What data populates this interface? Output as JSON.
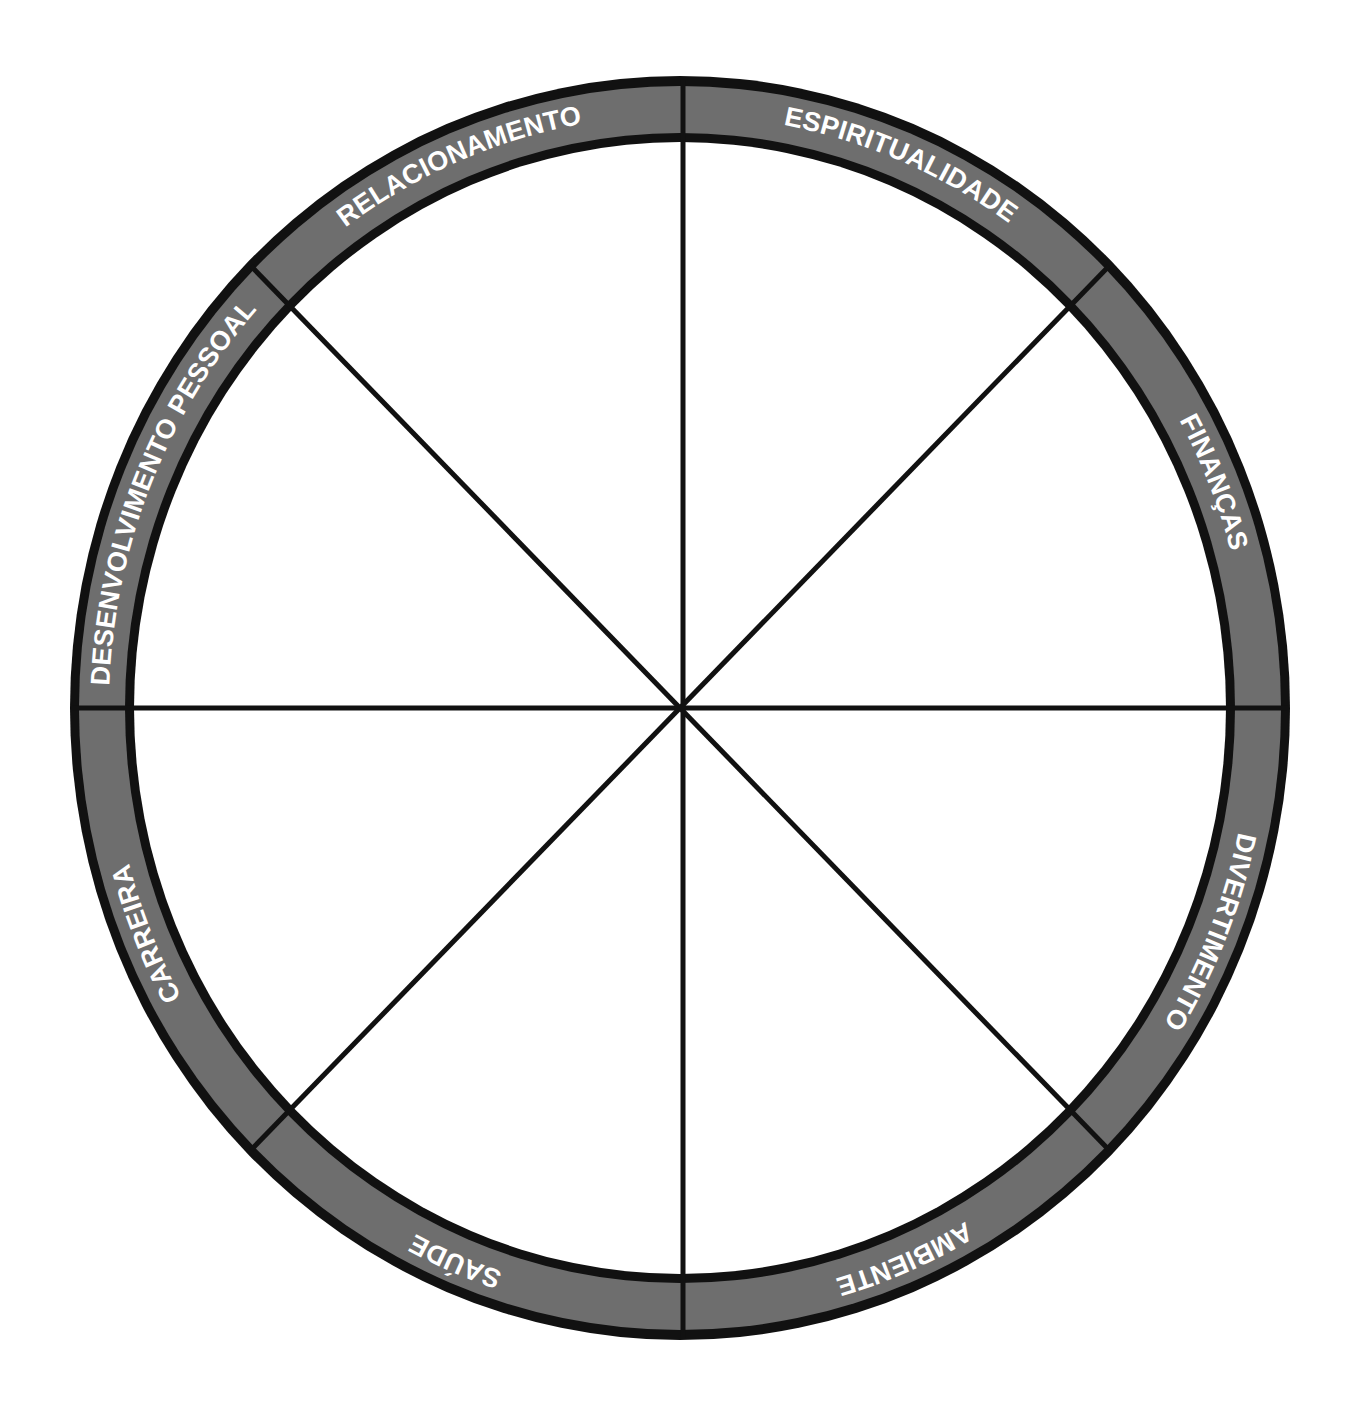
{
  "diagram": {
    "type": "wheel-of-life",
    "colors": {
      "background": "#ffffff",
      "ring_fill": "#6e6e6e",
      "ring_stroke": "#111111",
      "label": "#ffffff",
      "spokes": "#111111"
    },
    "sectors": [
      {
        "label": "DESENVOLVIMENTO PESSOAL"
      },
      {
        "label": "RELACIONAMENTO"
      },
      {
        "label": "ESPIRITUALIDADE"
      },
      {
        "label": "FINANÇAS"
      },
      {
        "label": "DIVERTIMENTO"
      },
      {
        "label": "AMBIENTE"
      },
      {
        "label": "SAÚDE"
      },
      {
        "label": "CARREIRA"
      }
    ]
  }
}
